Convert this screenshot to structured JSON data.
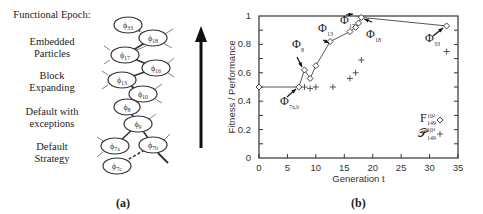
{
  "panel_a": {
    "header": "Functional Epoch:",
    "epochs": [
      {
        "label": "Embedded\nParticles",
        "line1": "Embedded",
        "line2": "Particles"
      },
      {
        "label": "Block\nExpanding",
        "line1": "Block",
        "line2": "Expanding"
      },
      {
        "label": "Default with\nexceptions",
        "line1": "Default with",
        "line2": "exceptions"
      },
      {
        "label": "Default\nStrategy",
        "line1": "Default",
        "line2": "Strategy"
      }
    ],
    "nodes": [
      "φ33",
      "φ18",
      "φ17",
      "φ16",
      "φ13",
      "φ10",
      "φ8",
      "φ9",
      "φ7a",
      "φ7b",
      "φ7c"
    ],
    "caption": "(a)",
    "arrow": "upward-time-arrow"
  },
  "panel_b": {
    "caption": "(b)",
    "annotations": [
      "Φ33",
      "Φ17",
      "Φ18",
      "Φ13",
      "Φ8",
      "Φ7a,b"
    ],
    "legend": [
      {
        "label": "F_149^{10^4}",
        "marker": "diamond"
      },
      {
        "label": "P_149^{10^4}",
        "marker": "plus"
      }
    ]
  },
  "chart_data": {
    "type": "line",
    "title": "",
    "xlabel": "Generation t",
    "ylabel": "Fitness / Performance",
    "xlim": [
      0,
      35
    ],
    "ylim": [
      0,
      1
    ],
    "xticks": [
      0,
      5,
      10,
      15,
      20,
      25,
      30,
      35
    ],
    "yticks": [
      0,
      0.2,
      0.4,
      0.6,
      0.8,
      1
    ],
    "ytick_labels": [
      "0",
      "0.2",
      "0.4",
      "0.6",
      "0.8",
      "1"
    ],
    "grid": false,
    "legend_position": "lower right",
    "series": [
      {
        "name": "Fitness F (diamond)",
        "marker": "diamond",
        "line": true,
        "x": [
          0,
          7,
          8,
          9,
          10,
          12.5,
          16,
          17,
          17.5,
          18,
          33
        ],
        "y": [
          0.5,
          0.5,
          0.62,
          0.56,
          0.65,
          0.82,
          0.89,
          0.92,
          0.95,
          0.99,
          0.93
        ]
      },
      {
        "name": "Performance P (plus)",
        "marker": "plus",
        "line": false,
        "x": [
          8,
          9,
          10,
          13,
          16,
          17,
          18,
          33
        ],
        "y": [
          0.5,
          0.49,
          0.5,
          0.5,
          0.56,
          0.6,
          0.69,
          0.75
        ]
      }
    ],
    "point_annotations": [
      {
        "label": "Φ7a,b",
        "x": 7,
        "y": 0.5
      },
      {
        "label": "Φ8",
        "x": 8,
        "y": 0.62
      },
      {
        "label": "Φ13",
        "x": 12.5,
        "y": 0.82
      },
      {
        "label": "Φ17",
        "x": 17,
        "y": 0.92
      },
      {
        "label": "Φ18",
        "x": 18,
        "y": 0.99
      },
      {
        "label": "Φ33",
        "x": 33,
        "y": 0.93
      }
    ]
  }
}
